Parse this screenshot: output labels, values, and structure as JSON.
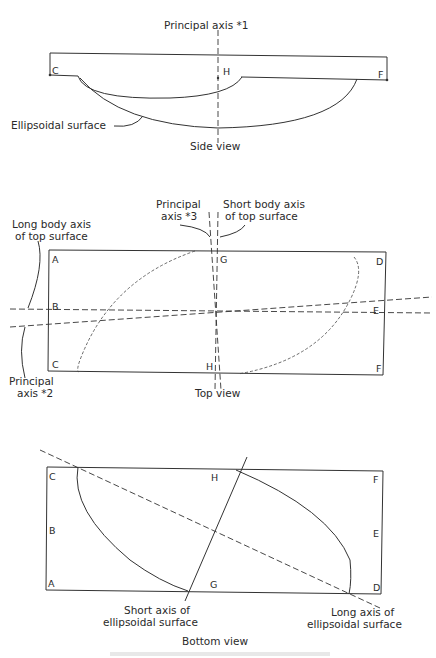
{
  "side_view": {
    "title": "Side view",
    "axis_label": "Principal axis *1",
    "surface_label": "Ellipsoidal surface",
    "points": [
      "C",
      "H",
      "F"
    ]
  },
  "top_view": {
    "title": "Top view",
    "labels": {
      "principal_axis_3_line1": "Principal",
      "principal_axis_3_line2": "axis *3",
      "short_body_axis_line1": "Short body axis",
      "short_body_axis_line2": "of top surface",
      "long_body_axis_line1": "Long body axis",
      "long_body_axis_line2": "of top surface",
      "principal_axis_2_line1": "Principal",
      "principal_axis_2_line2": "axis *2"
    },
    "points": [
      "A",
      "G",
      "D",
      "B",
      "E",
      "C",
      "H",
      "F"
    ]
  },
  "bottom_view": {
    "title": "Bottom view",
    "labels": {
      "short_axis_line1": "Short axis of",
      "short_axis_line2": "ellipsoidal surface",
      "long_axis_line1": "Long axis of",
      "long_axis_line2": "ellipsoidal surface"
    },
    "points": [
      "C",
      "H",
      "F",
      "B",
      "E",
      "A",
      "G",
      "D"
    ]
  }
}
